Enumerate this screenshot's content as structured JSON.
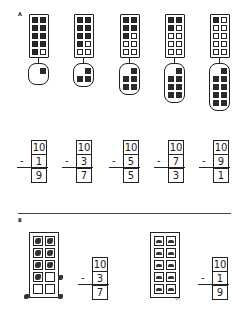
{
  "section_a": {
    "label": "A",
    "frames": [
      {
        "filled": 9,
        "taken": 1
      },
      {
        "filled": 7,
        "taken": 3
      },
      {
        "filled": 5,
        "taken": 5
      },
      {
        "filled": 3,
        "taken": 7
      },
      {
        "filled": 1,
        "taken": 9
      }
    ],
    "problems": [
      {
        "minuend": "10",
        "subtrahend": "1",
        "difference": "9",
        "operator": "-"
      },
      {
        "minuend": "10",
        "subtrahend": "3",
        "difference": "7",
        "operator": "-"
      },
      {
        "minuend": "10",
        "subtrahend": "5",
        "difference": "5",
        "operator": "-"
      },
      {
        "minuend": "10",
        "subtrahend": "7",
        "difference": "3",
        "operator": "-"
      },
      {
        "minuend": "10",
        "subtrahend": "9",
        "difference": "1",
        "operator": "-"
      }
    ]
  },
  "section_b": {
    "label": "B",
    "items": [
      {
        "picture": "bird-icon",
        "remaining": 7,
        "removed": 3,
        "problem": {
          "minuend": "10",
          "subtrahend": "3",
          "difference": "7",
          "operator": "-"
        }
      },
      {
        "picture": "car-icon",
        "remaining": 9,
        "removed": 1,
        "problem": {
          "minuend": "10",
          "subtrahend": "1",
          "difference": "9",
          "operator": "-"
        }
      }
    ]
  }
}
